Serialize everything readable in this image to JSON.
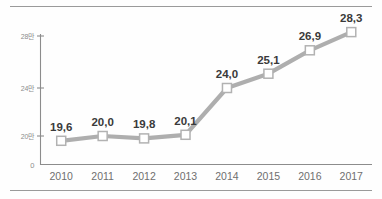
{
  "chart_data": {
    "type": "line",
    "title": "",
    "subtitle": "",
    "xlabel": "",
    "ylabel": "",
    "categories": [
      "2010",
      "2011",
      "2012",
      "2013",
      "2014",
      "2015",
      "2016",
      "2017"
    ],
    "values": [
      19.6,
      20.0,
      19.8,
      20.1,
      24.0,
      25.1,
      26.9,
      28.3
    ],
    "value_labels": [
      "19,6",
      "20,0",
      "19,8",
      "20,1",
      "24,0",
      "25,1",
      "26,9",
      "28,3"
    ],
    "series": [
      {
        "name": "",
        "values": [
          19.6,
          20.0,
          19.8,
          20.1,
          24.0,
          25.1,
          26.9,
          28.3
        ]
      }
    ],
    "y_ticks": [
      0,
      20,
      24,
      28
    ],
    "y_tick_labels": [
      "0",
      "20만",
      "24만",
      "28만"
    ],
    "ylim": [
      0,
      29.6
    ],
    "unit_suffix": "만",
    "decimal_separator": ",",
    "grid": false,
    "legend": "none",
    "marker": "square",
    "colors": {
      "line": "#aeaeae",
      "marker_fill": "#ffffff",
      "marker_stroke": "#b2b2b2",
      "axis": "#8c8c8c",
      "value_label": "#3a3a3a",
      "x_tick_label": "#6f6f6f",
      "y_tick_label": "#8d8d8d",
      "rule": "#9a9a9a",
      "background": "#fefefe"
    }
  }
}
